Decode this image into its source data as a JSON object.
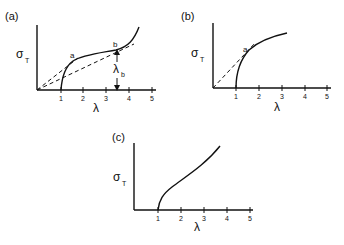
{
  "figure": {
    "panels": [
      {
        "id": "a",
        "label": "(a)",
        "ylabel": "σ",
        "ylabel_sub": "T",
        "xlabel": "λ",
        "ticks": [
          "1",
          "2",
          "3",
          "4",
          "5"
        ],
        "points": [
          {
            "name": "a"
          },
          {
            "name": "b"
          }
        ],
        "annotation": "λ",
        "annotation_sub": "b"
      },
      {
        "id": "b",
        "label": "(b)",
        "ylabel": "σ",
        "ylabel_sub": "T",
        "xlabel": "λ",
        "ticks": [
          "1",
          "2",
          "3",
          "4",
          "5"
        ],
        "points": [
          {
            "name": "a"
          }
        ]
      },
      {
        "id": "c",
        "label": "(c)",
        "ylabel": "σ",
        "ylabel_sub": "T",
        "xlabel": "λ",
        "ticks": [
          "1",
          "2",
          "3",
          "4",
          "5"
        ]
      }
    ]
  }
}
